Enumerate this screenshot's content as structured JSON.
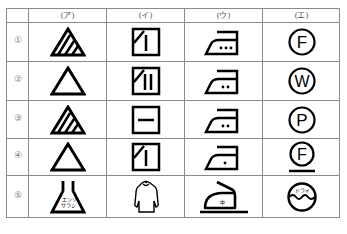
{
  "table": {
    "column_headers": [
      "(ア)",
      "(イ)",
      "(ウ)",
      "(エ)"
    ],
    "row_labels": [
      "①",
      "②",
      "③",
      "④",
      "⑤"
    ],
    "cells": [
      [
        "bleach-triangle-striped-icon",
        "dry-square-shade-vertical-line-icon",
        "iron-three-dots-icon",
        "dryclean-circle-F-icon"
      ],
      [
        "bleach-triangle-plain-icon",
        "dry-square-shade-two-lines-icon",
        "iron-two-dots-icon",
        "wetclean-circle-W-icon"
      ],
      [
        "bleach-triangle-striped-icon",
        "dry-square-horizontal-line-icon",
        "iron-two-dots-icon",
        "dryclean-circle-P-icon"
      ],
      [
        "bleach-triangle-plain-icon",
        "dry-square-shade-vertical-line-icon",
        "iron-one-dot-icon",
        "dryclean-circle-F-underline-icon"
      ],
      [
        "chlorine-flask-icon",
        "hang-dry-sweater-icon",
        "iron-medium-on-pad-icon",
        "dry-tub-icon"
      ]
    ],
    "flask_text": [
      "エンソ",
      "サラシ"
    ],
    "iron_text": "中",
    "tub_text": "ドライ",
    "circle_letters": [
      "F",
      "W",
      "P",
      "F"
    ]
  }
}
